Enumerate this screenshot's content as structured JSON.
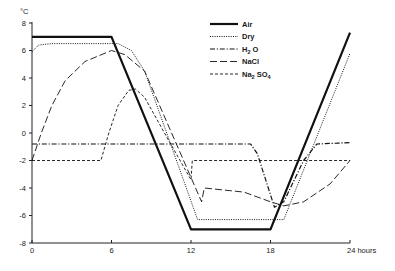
{
  "chart_data": {
    "type": "line",
    "title": "",
    "xlabel": "hours",
    "ylabel": "°C",
    "xlim": [
      0,
      24
    ],
    "ylim": [
      -8,
      8
    ],
    "x_ticks": [
      0,
      6,
      12,
      18,
      24
    ],
    "x_tick_labels": [
      "0",
      "6",
      "12",
      "18",
      "24 hours"
    ],
    "y_ticks": [
      8,
      6,
      4,
      2,
      0,
      -2,
      -4,
      -6,
      -8
    ],
    "y_tick_labels": [
      "8",
      "6",
      "4",
      "2",
      "0",
      "-2",
      "-4",
      "-6",
      "-8"
    ],
    "grid": false,
    "legend_position": "upper-center-right",
    "series": [
      {
        "name": "Air",
        "style": "solid-thick",
        "points": [
          [
            0,
            7.0
          ],
          [
            6,
            7.0
          ],
          [
            12,
            -7.0
          ],
          [
            18,
            -7.0
          ],
          [
            24,
            7.3
          ]
        ]
      },
      {
        "name": "Dry",
        "style": "dotted",
        "points": [
          [
            0,
            5.9
          ],
          [
            0.5,
            6.4
          ],
          [
            1.5,
            6.5
          ],
          [
            6.5,
            6.5
          ],
          [
            7.5,
            6.0
          ],
          [
            8.5,
            4.5
          ],
          [
            12.5,
            -6.3
          ],
          [
            19,
            -6.3
          ],
          [
            24,
            5.8
          ]
        ]
      },
      {
        "name": "H2O",
        "style": "dash-dot",
        "points": [
          [
            0,
            -0.8
          ],
          [
            16.5,
            -0.8
          ],
          [
            17,
            -1.5
          ],
          [
            18.3,
            -5.4
          ],
          [
            19,
            -5.0
          ],
          [
            20.5,
            -2.0
          ],
          [
            21.5,
            -0.8
          ],
          [
            24,
            -0.7
          ]
        ]
      },
      {
        "name": "NaCl",
        "style": "long-dash",
        "points": [
          [
            0,
            -2.0
          ],
          [
            0.7,
            0.0
          ],
          [
            1.5,
            2.0
          ],
          [
            2.5,
            3.8
          ],
          [
            4.0,
            5.2
          ],
          [
            6.0,
            6.0
          ],
          [
            7.0,
            5.7
          ],
          [
            8.5,
            4.5
          ],
          [
            12.8,
            -5.0
          ],
          [
            13.0,
            -4.0
          ],
          [
            16.0,
            -4.3
          ],
          [
            18.0,
            -5.0
          ],
          [
            19.0,
            -5.3
          ],
          [
            20.5,
            -5.0
          ],
          [
            22.5,
            -3.7
          ],
          [
            24,
            -2.0
          ]
        ]
      },
      {
        "name": "Na2SO4",
        "style": "short-dash",
        "points": [
          [
            0,
            -2.0
          ],
          [
            5.2,
            -2.0
          ],
          [
            5.8,
            0.0
          ],
          [
            6.5,
            2.0
          ],
          [
            7.3,
            3.1
          ],
          [
            7.8,
            3.2
          ],
          [
            8.5,
            2.6
          ],
          [
            10,
            0.0
          ],
          [
            12.0,
            -3.4
          ],
          [
            12.1,
            -2.0
          ],
          [
            24,
            -2.0
          ]
        ]
      }
    ],
    "legend": [
      {
        "label": "Air",
        "base": "Air",
        "sub": ""
      },
      {
        "label": "Dry",
        "base": "Dry",
        "sub": ""
      },
      {
        "label": "H2O",
        "base": "H",
        "sub": "2",
        "tail": " O"
      },
      {
        "label": "NaCl",
        "base": "NaCl",
        "sub": ""
      },
      {
        "label": "Na2SO4",
        "base": "Na",
        "sub": "2",
        "tail": " SO",
        "sub2": "4"
      }
    ]
  },
  "colors": {
    "line": "#111111",
    "axis": "#222222",
    "background": "#ffffff"
  }
}
